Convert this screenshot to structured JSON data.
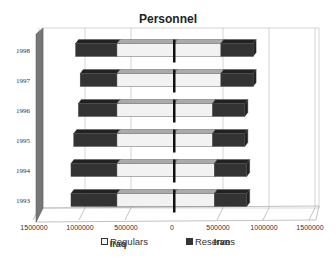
{
  "title": "Personnel",
  "legend": [
    {
      "label": "Regulars",
      "color": "#f2f2f2"
    },
    {
      "label": "Reserves",
      "color": "#333333"
    }
  ],
  "axis": {
    "left_label": "Iraq",
    "right_label": "Iran",
    "ticks": [
      "1500000",
      "1000000",
      "500000",
      "0",
      "500000",
      "1000000",
      "1500000"
    ]
  },
  "chart_data": {
    "type": "bar",
    "title": "Personnel",
    "orientation": "horizontal-butterfly-3d-stacked",
    "categories": [
      "1993",
      "1994",
      "1995",
      "1996",
      "1997",
      "1998"
    ],
    "groups": [
      "Iraq",
      "Iran"
    ],
    "series": [
      {
        "name": "Iraq Regulars",
        "values": [
          620000,
          620000,
          620000,
          620000,
          620000,
          620000
        ]
      },
      {
        "name": "Iraq Reserves",
        "values": [
          500000,
          500000,
          470000,
          420000,
          400000,
          450000
        ]
      },
      {
        "name": "Iran Regulars",
        "values": [
          440000,
          440000,
          420000,
          420000,
          510000,
          510000
        ]
      },
      {
        "name": "Iran Reserves",
        "values": [
          350000,
          350000,
          350000,
          350000,
          350000,
          350000
        ]
      }
    ],
    "xlabel": "Iraq  |  Iran",
    "ylabel": "",
    "xlim": [
      -1500000,
      1500000
    ],
    "grid": true,
    "legend_position": "bottom"
  }
}
